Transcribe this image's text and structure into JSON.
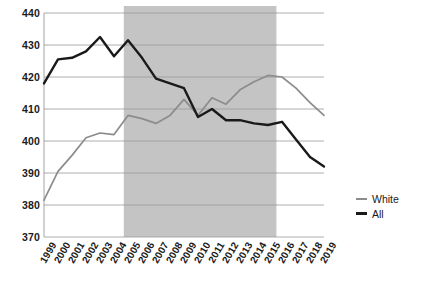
{
  "chart_data": {
    "type": "line",
    "title": "",
    "subtitle": "",
    "xlabel": "",
    "ylabel": "",
    "x": [
      "1999",
      "2000",
      "2001",
      "2002",
      "2003",
      "2004",
      "2005",
      "2006",
      "2007",
      "2008",
      "2009",
      "2010",
      "2011",
      "2012",
      "2013",
      "2014",
      "2015",
      "2016",
      "2017",
      "2018",
      "2019"
    ],
    "xlim": [
      "1999",
      "2019"
    ],
    "ylim": [
      370,
      440
    ],
    "yticks": [
      370,
      380,
      390,
      400,
      410,
      420,
      430,
      440
    ],
    "ytick_labels": [
      "370",
      "380",
      "390",
      "400",
      "410",
      "420",
      "430",
      "440"
    ],
    "grid": "horizontal",
    "legend_position": "right-middle",
    "series": [
      {
        "name": "White",
        "color": "#8c8c8c",
        "width": 1.7,
        "values": [
          381.5,
          390.5,
          395.5,
          401.0,
          402.5,
          402.0,
          408.0,
          407.0,
          405.5,
          408.0,
          413.0,
          408.0,
          413.5,
          411.5,
          416.0,
          418.5,
          420.5,
          420.0,
          416.5,
          412.0,
          408.0
        ]
      },
      {
        "name": "All",
        "color": "#1a1a1a",
        "width": 2.4,
        "values": [
          418.0,
          425.5,
          426.0,
          428.0,
          432.5,
          426.5,
          431.5,
          426.0,
          419.5,
          418.0,
          416.5,
          407.5,
          410.0,
          406.5,
          406.5,
          405.5,
          405.0,
          406.0,
          400.5,
          395.0,
          392.0
        ]
      }
    ],
    "shaded_region": {
      "from": "2004.7",
      "to": "2015.6",
      "color": "#c4c4c4"
    },
    "gridline_color": "#9a9a9a",
    "background": "#ffffff"
  },
  "legend": {
    "items": [
      {
        "label": "White",
        "color": "#8c8c8c",
        "thickness": 2
      },
      {
        "label": "All",
        "color": "#1a1a1a",
        "thickness": 3
      }
    ]
  }
}
